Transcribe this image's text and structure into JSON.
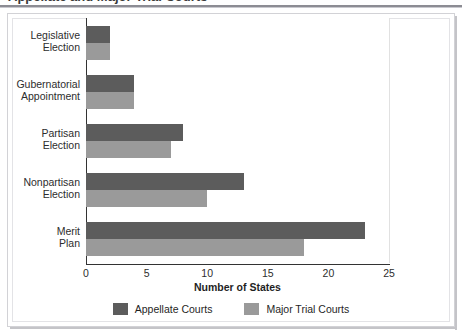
{
  "figure": {
    "cut_off_title": "Appellate and Major Trial Courts",
    "frame_color": "#d2d2d6"
  },
  "chart_data": {
    "type": "bar",
    "orientation": "horizontal",
    "title": "",
    "xlabel": "Number of States",
    "ylabel": "",
    "xlim": [
      0,
      25
    ],
    "xticks": [
      "0",
      "5",
      "10",
      "15",
      "20",
      "25"
    ],
    "grid": true,
    "legend_position": "bottom",
    "categories": [
      "Legislative Election",
      "Gubernatorial Appointment",
      "Partisan Election",
      "Nonpartisan Election",
      "Merit Plan"
    ],
    "category_lines": [
      [
        "Legislative",
        "Election"
      ],
      [
        "Gubernatorial",
        "Appointment"
      ],
      [
        "Partisan",
        "Election"
      ],
      [
        "Nonpartisan",
        "Election"
      ],
      [
        "Merit",
        "Plan"
      ]
    ],
    "series": [
      {
        "name": "Appellate Courts",
        "color": "#5c5c5c",
        "values": [
          2,
          4,
          8,
          13,
          23
        ]
      },
      {
        "name": "Major Trial Courts",
        "color": "#9a9a9a",
        "values": [
          2,
          4,
          7,
          10,
          18
        ]
      }
    ]
  }
}
